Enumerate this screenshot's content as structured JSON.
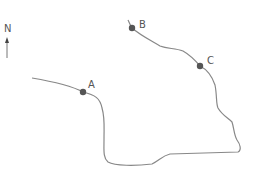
{
  "compass": {
    "label": "N"
  },
  "points": [
    {
      "id": "A",
      "label": "A",
      "x": 83,
      "y": 92
    },
    {
      "id": "B",
      "label": "B",
      "x": 132,
      "y": 28
    },
    {
      "id": "C",
      "label": "C",
      "x": 200,
      "y": 66
    }
  ],
  "colors": {
    "line": "#888888",
    "point": "#555555",
    "text": "#555555"
  }
}
